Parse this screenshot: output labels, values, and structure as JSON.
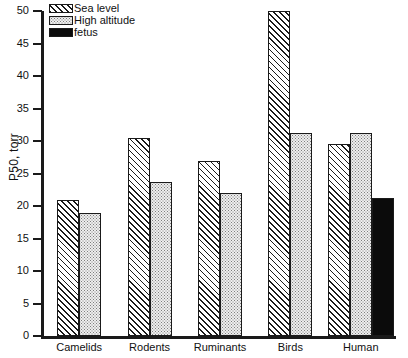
{
  "chart_data": {
    "type": "bar",
    "title": "",
    "xlabel": "",
    "ylabel": "P50, torr",
    "ylim": [
      0,
      50
    ],
    "yticks": [
      0,
      5,
      10,
      15,
      20,
      25,
      30,
      35,
      40,
      45,
      50
    ],
    "grid": false,
    "legend_position": "top-left",
    "categories": [
      "Camelids",
      "Rodents",
      "Ruminants",
      "Birds",
      "Human"
    ],
    "series": [
      {
        "name": "Sea level",
        "pattern": "diagonal-hatch",
        "color": "#ffffff",
        "values": [
          21,
          30.5,
          27,
          50,
          29.5
        ]
      },
      {
        "name": "High altitude",
        "pattern": "fine-dots",
        "color": "#eeeeee",
        "values": [
          19,
          23.7,
          22,
          31.3,
          31.3
        ]
      },
      {
        "name": "fetus",
        "pattern": "solid-black",
        "color": "#0b0b0b",
        "values": [
          null,
          null,
          null,
          null,
          21.3
        ]
      }
    ]
  },
  "axis": {
    "y_title": "P50, torr",
    "y_tick_labels": [
      "0",
      "5",
      "10",
      "15",
      "20",
      "25",
      "30",
      "35",
      "40",
      "45",
      "50"
    ],
    "x_tick_labels": [
      "Camelids",
      "Rodents",
      "Ruminants",
      "Birds",
      "Human"
    ]
  },
  "legend": {
    "items": [
      {
        "label": "Sea level"
      },
      {
        "label": "High altitude"
      },
      {
        "label": "fetus"
      }
    ]
  }
}
